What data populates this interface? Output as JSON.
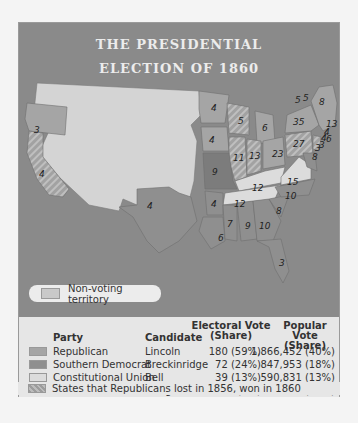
{
  "title": {
    "line1": "THE PRESIDENTIAL",
    "line2": "ELECTION OF 1860"
  },
  "map": {
    "non_voting_label": "Non-voting territory",
    "state_labels": [
      {
        "state": "Oregon",
        "votes": "3",
        "x": 15,
        "y": 52
      },
      {
        "state": "California",
        "votes": "4",
        "x": 20,
        "y": 96
      },
      {
        "state": "Texas",
        "votes": "4",
        "x": 128,
        "y": 128
      },
      {
        "state": "Minnesota",
        "votes": "4",
        "x": 192,
        "y": 27
      },
      {
        "state": "Iowa",
        "votes": "4",
        "x": 188,
        "y": 62
      },
      {
        "state": "Missouri",
        "votes": "9",
        "x": 185,
        "y": 95
      },
      {
        "state": "Arkansas",
        "votes": "4",
        "x": 186,
        "y": 123
      },
      {
        "state": "Louisiana",
        "votes": "6",
        "x": 186,
        "y": 160
      },
      {
        "state": "Wisconsin",
        "votes": "5",
        "x": 217,
        "y": 43
      },
      {
        "state": "Michigan",
        "votes": "6",
        "x": 244,
        "y": 50
      },
      {
        "state": "Illinois",
        "votes": "11",
        "x": 212,
        "y": 77
      },
      {
        "state": "Indiana",
        "votes": "13",
        "x": 231,
        "y": 75
      },
      {
        "state": "Ohio",
        "votes": "23",
        "x": 254,
        "y": 72
      },
      {
        "state": "Kentucky",
        "votes": "12",
        "x": 222,
        "y": 112
      },
      {
        "state": "Tennessee",
        "votes": "12",
        "x": 217,
        "y": 130
      },
      {
        "state": "Mississippi",
        "votes": "7",
        "x": 203,
        "y": 150
      },
      {
        "state": "Alabama",
        "votes": "9",
        "x": 221,
        "y": 152
      },
      {
        "state": "Georgia",
        "votes": "10",
        "x": 240,
        "y": 148
      },
      {
        "state": "Florida",
        "votes": "3",
        "x": 257,
        "y": 183
      },
      {
        "state": "South Carolina",
        "votes": "8",
        "x": 256,
        "y": 135
      },
      {
        "state": "North Carolina",
        "votes": "10",
        "x": 263,
        "y": 120
      },
      {
        "state": "Virginia",
        "votes": "15",
        "x": 265,
        "y": 105
      },
      {
        "state": "Pennsylvania",
        "votes": "27",
        "x": 271,
        "y": 64
      },
      {
        "state": "New York",
        "votes": "35",
        "x": 275,
        "y": 46
      },
      {
        "state": "Vermont",
        "votes": "5",
        "x": 282,
        "y": 19
      },
      {
        "state": "New Hampshire",
        "votes": "5",
        "x": 291,
        "y": 17
      },
      {
        "state": "Maine",
        "votes": "8",
        "x": 302,
        "y": 23
      },
      {
        "state": "Massachusetts",
        "votes": "13",
        "x": 316,
        "y": 41
      },
      {
        "state": "Rhode Island",
        "votes": "4",
        "x": 305,
        "y": 53
      },
      {
        "state": "Connecticut",
        "votes": "6",
        "x": 311,
        "y": 61
      },
      {
        "state": "New Jersey",
        "votes": "4",
        "x": 296,
        "y": 65
      },
      {
        "state": "Delaware",
        "votes": "3",
        "x": 297,
        "y": 72
      },
      {
        "state": "Maryland",
        "votes": "3",
        "x": 289,
        "y": 76
      },
      {
        "state": "Virginia-coast",
        "votes": "8",
        "x": 293,
        "y": 87
      }
    ]
  },
  "legend": {
    "headers": {
      "party": "Party",
      "candidate": "Candidate",
      "electoral_line1": "Electoral Vote",
      "electoral_line2": "(Share)",
      "popular_line1": "Popular Vote",
      "popular_line2": "(Share)"
    },
    "rows": [
      {
        "party": "Republican",
        "candidate": "Lincoln",
        "electoral": "180 (59%)",
        "popular": "1,866,452 (40%)",
        "color": "#a5a5a5"
      },
      {
        "party": "Southern Democrat",
        "candidate": "Breckinridge",
        "electoral": "72 (24%)",
        "popular": "847,953 (18%)",
        "color": "#8f8f8f"
      },
      {
        "party": "Constitutional Union",
        "candidate": "Bell",
        "electoral": "39 (13%)",
        "popular": "590,831 (13%)",
        "color": "#dcdcdc"
      },
      {
        "party": "Northern Democrat",
        "candidate": "Douglas",
        "electoral": "12 (4%)",
        "popular": "1,371,157 (29%)",
        "color": "#7c7c7c"
      }
    ],
    "note": "States that Republicans lost in 1856, won in 1860"
  }
}
